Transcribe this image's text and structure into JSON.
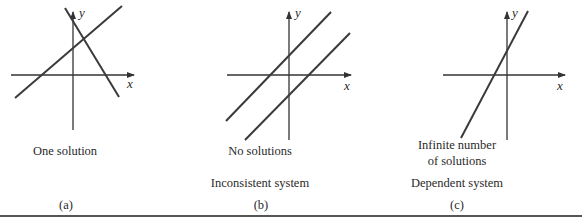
{
  "figure": {
    "panels": [
      {
        "id": "a",
        "tag": "(a)",
        "caption": "One solution",
        "system_type": "",
        "axis_labels": {
          "x": "x",
          "y": "y"
        },
        "lines": [
          {
            "name": "line-positive-slope",
            "from": [
              15,
              98
            ],
            "to": [
              122,
              6
            ]
          },
          {
            "name": "line-negative-slope",
            "from": [
              65,
              8
            ],
            "to": [
              119,
              97
            ]
          }
        ]
      },
      {
        "id": "b",
        "tag": "(b)",
        "caption": "No solutions",
        "system_type": "Inconsistent system",
        "axis_labels": {
          "x": "x",
          "y": "y"
        },
        "lines": [
          {
            "name": "line-upper-parallel",
            "from": [
              226,
              121
            ],
            "to": [
              331,
              12
            ]
          },
          {
            "name": "line-lower-parallel",
            "from": [
              245,
              140
            ],
            "to": [
              350,
              33
            ]
          }
        ]
      },
      {
        "id": "c",
        "tag": "(c)",
        "caption_line1": "Infinite number",
        "caption_line2": "of solutions",
        "system_type": "Dependent system",
        "axis_labels": {
          "x": "x",
          "y": "y"
        },
        "lines": [
          {
            "name": "line-coincident",
            "from": [
              461,
              138
            ],
            "to": [
              528,
              11
            ]
          }
        ]
      }
    ],
    "colors": {
      "ink": "#3a3a3a",
      "background": "#ffffff"
    }
  }
}
